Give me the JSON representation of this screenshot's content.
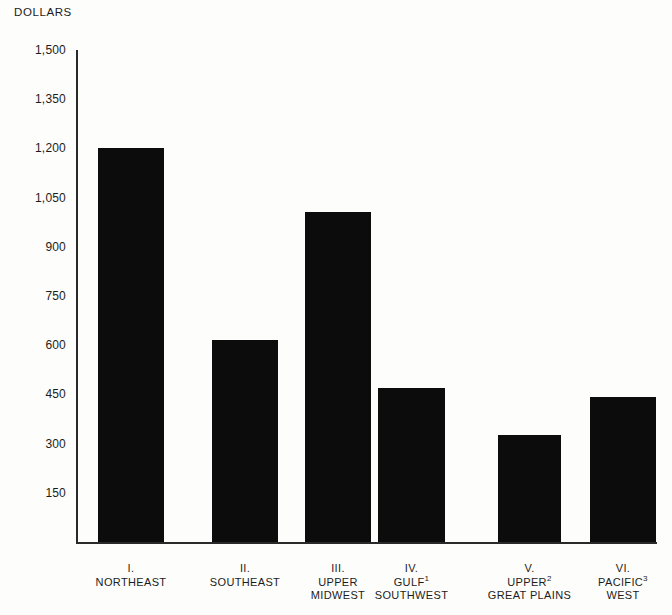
{
  "chart_data": {
    "type": "bar",
    "title": "",
    "subtitle": "",
    "xlabel": "",
    "ylabel": "DOLLARS",
    "ylim": [
      0,
      1500
    ],
    "ytick_labels": [
      "1,500",
      "1,350",
      "1,200",
      "1,050",
      "900",
      "750",
      "600",
      "450",
      "300",
      "150"
    ],
    "ytick_values": [
      1500,
      1350,
      1200,
      1050,
      900,
      750,
      600,
      450,
      300,
      150
    ],
    "grid": false,
    "legend": "none",
    "bar_color": "#0c0c0c",
    "categories": [
      "I. NORTHEAST",
      "II. SOUTHEAST",
      "III. UPPER MIDWEST",
      "IV. GULF SOUTHWEST",
      "V. UPPER GREAT PLAINS",
      "VI. PACIFIC WEST"
    ],
    "values": [
      1200,
      617,
      1007,
      470,
      325,
      442
    ]
  },
  "axis": {
    "y_title": "DOLLARS"
  },
  "categories": [
    {
      "numeral": "I.",
      "name": "NORTHEAST",
      "name2": "",
      "footnote": ""
    },
    {
      "numeral": "II.",
      "name": "SOUTHEAST",
      "name2": "",
      "footnote": ""
    },
    {
      "numeral": "III.",
      "name": "UPPER",
      "name2": "MIDWEST",
      "footnote": ""
    },
    {
      "numeral": "IV.",
      "name": "GULF",
      "name2": "SOUTHWEST",
      "footnote": "1"
    },
    {
      "numeral": "V.",
      "name": "UPPER",
      "name2": "GREAT PLAINS",
      "footnote": "2"
    },
    {
      "numeral": "VI.",
      "name": "PACIFIC",
      "name2": "WEST",
      "footnote": "3"
    }
  ]
}
